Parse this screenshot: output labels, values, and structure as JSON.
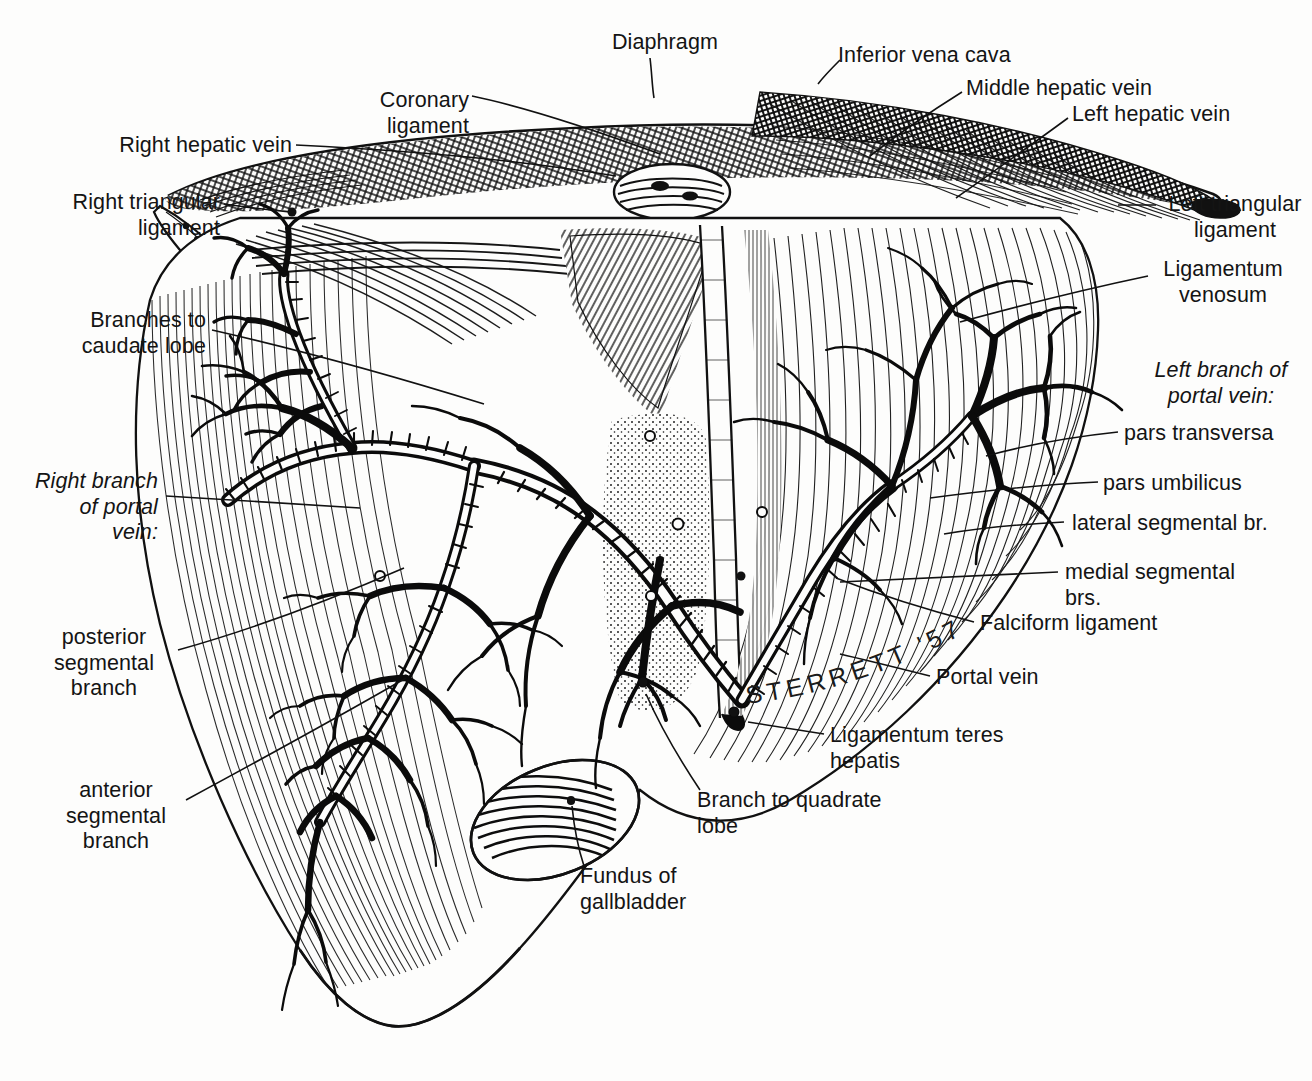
{
  "running_head": {
    "title": "THE LIVER",
    "page_number": "47"
  },
  "figure": {
    "signature": "STERRETT '57",
    "style": "pen-and-ink engraving / line hatching",
    "ink_color": "#111111",
    "paper_color": "#fdfdfc"
  },
  "labels": [
    {
      "id": "coronary-ligament",
      "text": "Coronary ligament",
      "align": "right",
      "x": 297,
      "y": 88,
      "w": 172
    },
    {
      "id": "diaphragm",
      "text": "Diaphragm",
      "align": "right",
      "x": 606,
      "y": 30,
      "w": 112
    },
    {
      "id": "inferior-vena-cava",
      "text": "Inferior vena cava",
      "align": "left",
      "x": 838,
      "y": 43,
      "w": 180
    },
    {
      "id": "middle-hepatic-vein",
      "text": "Middle hepatic vein",
      "align": "left",
      "x": 966,
      "y": 76,
      "w": 190
    },
    {
      "id": "left-hepatic-vein",
      "text": "Left hepatic vein",
      "align": "left",
      "x": 1072,
      "y": 102,
      "w": 166
    },
    {
      "id": "right-hepatic-vein",
      "text": "Right hepatic vein",
      "align": "right",
      "x": 112,
      "y": 133,
      "w": 180
    },
    {
      "id": "right-triangular-ligament",
      "text": "Right triangular\nligament",
      "align": "right",
      "x": 52,
      "y": 190,
      "w": 168
    },
    {
      "id": "left-triangular-ligament",
      "text": "Left triangular\nligament",
      "align": "center",
      "x": 1160,
      "y": 192,
      "w": 150
    },
    {
      "id": "ligamentum-venosum",
      "text": "Ligamentum\nvenosum",
      "align": "center",
      "x": 1153,
      "y": 257,
      "w": 140
    },
    {
      "id": "branches-to-caudate-lobe",
      "text": "Branches to\ncaudate lobe",
      "align": "right",
      "x": 44,
      "y": 308,
      "w": 162
    },
    {
      "id": "left-branch-portal-vein",
      "text": "Left branch of\nportal vein:",
      "align": "center",
      "x": 1143,
      "y": 358,
      "w": 156,
      "italic": true
    },
    {
      "id": "pars-transversa",
      "text": "pars transversa",
      "align": "left",
      "x": 1124,
      "y": 421,
      "w": 150
    },
    {
      "id": "right-branch-portal-vein",
      "text": "Right branch\nof portal\nvein:",
      "align": "right",
      "x": 28,
      "y": 469,
      "w": 130,
      "italic": true
    },
    {
      "id": "pars-umbilicus",
      "text": "pars umbilicus",
      "align": "left",
      "x": 1103,
      "y": 471,
      "w": 148
    },
    {
      "id": "lateral-segmental-br",
      "text": "lateral segmental br.",
      "align": "left",
      "x": 1072,
      "y": 511,
      "w": 200
    },
    {
      "id": "medial-segmental-brs",
      "text": "medial segmental brs.",
      "align": "left",
      "x": 1065,
      "y": 560,
      "w": 212
    },
    {
      "id": "falciform-ligament",
      "text": "Falciform ligament",
      "align": "left",
      "x": 980,
      "y": 611,
      "w": 180
    },
    {
      "id": "posterior-segmental-branch",
      "text": "posterior\nsegmental\nbranch",
      "align": "center",
      "x": 38,
      "y": 625,
      "w": 132
    },
    {
      "id": "portal-vein",
      "text": "Portal vein",
      "align": "left",
      "x": 936,
      "y": 665,
      "w": 110
    },
    {
      "id": "ligamentum-teres-hepatis",
      "text": "Ligamentum teres hepatis",
      "align": "left",
      "x": 830,
      "y": 723,
      "w": 236
    },
    {
      "id": "branch-to-quadrate-lobe",
      "text": "Branch to quadrate lobe",
      "align": "left",
      "x": 697,
      "y": 788,
      "w": 228
    },
    {
      "id": "anterior-segmental-branch",
      "text": "anterior\nsegmental\nbranch",
      "align": "center",
      "x": 52,
      "y": 778,
      "w": 128
    },
    {
      "id": "fundus-of-gallbladder",
      "text": "Fundus of gallbladder",
      "align": "left",
      "x": 580,
      "y": 864,
      "w": 208
    }
  ]
}
